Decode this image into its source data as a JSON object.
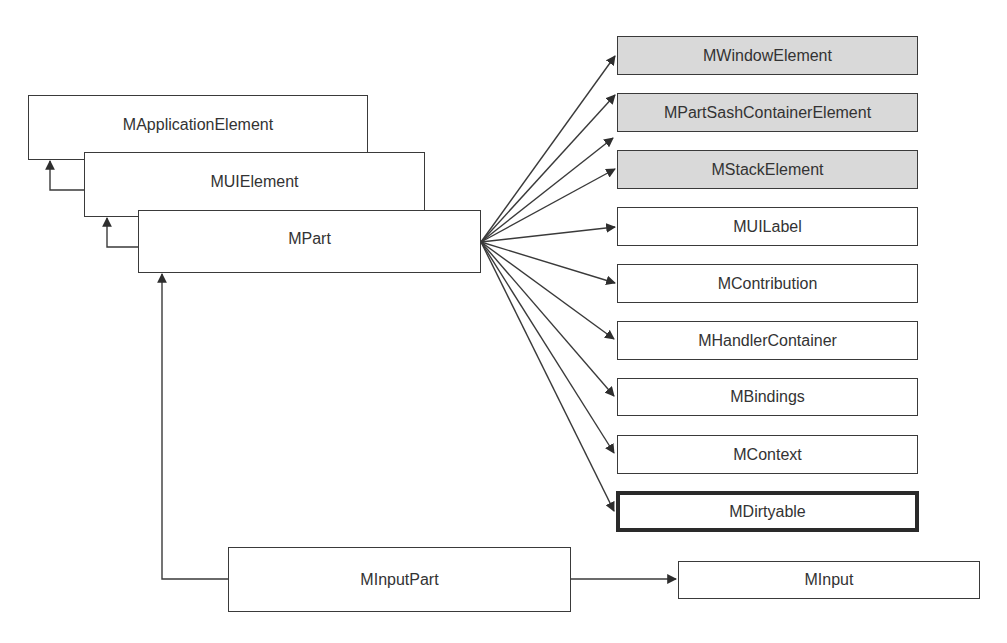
{
  "diagram": {
    "type": "class-hierarchy",
    "colors": {
      "line": "#3a3a3a",
      "box_fill": "#ffffff",
      "shaded_fill": "#d9d9d9",
      "text": "#333333"
    },
    "hierarchy": [
      {
        "id": "mapplicationelement",
        "label": "MApplicationElement"
      },
      {
        "id": "muielement",
        "label": "MUIElement"
      },
      {
        "id": "mpart",
        "label": "MPart"
      }
    ],
    "mpart_interfaces": [
      {
        "id": "mwindowelement",
        "label": "MWindowElement",
        "style": "shaded"
      },
      {
        "id": "mpartsashcontainerelement",
        "label": "MPartSashContainerElement",
        "style": "shaded"
      },
      {
        "id": "mstackelement",
        "label": "MStackElement",
        "style": "shaded"
      },
      {
        "id": "muilabel",
        "label": "MUILabel",
        "style": "plain"
      },
      {
        "id": "mcontribution",
        "label": "MContribution",
        "style": "plain"
      },
      {
        "id": "mhandlercontainer",
        "label": "MHandlerContainer",
        "style": "plain"
      },
      {
        "id": "mbindings",
        "label": "MBindings",
        "style": "plain"
      },
      {
        "id": "mcontext",
        "label": "MContext",
        "style": "plain"
      },
      {
        "id": "mdirtyable",
        "label": "MDirtyable",
        "style": "bold"
      }
    ],
    "input_part": {
      "id": "minputpart",
      "label": "MInputPart"
    },
    "input": {
      "id": "minput",
      "label": "MInput"
    }
  }
}
